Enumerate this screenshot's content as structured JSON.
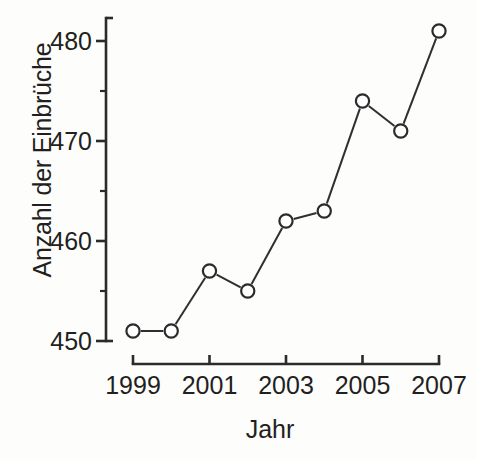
{
  "chart_data": {
    "type": "line",
    "title": "",
    "subtitle": "",
    "xlabel": "Jahr",
    "ylabel": "Anzahl der Einbrüche",
    "x": [
      1999,
      2000,
      2001,
      2002,
      2003,
      2004,
      2005,
      2006,
      2007
    ],
    "categories": [
      "1999",
      "2000",
      "2001",
      "2002",
      "2003",
      "2004",
      "2005",
      "2006",
      "2007"
    ],
    "values": [
      451,
      451,
      457,
      455,
      462,
      463,
      474,
      471,
      481
    ],
    "series": [
      {
        "name": "Anzahl der Einbrüche",
        "values": [
          451,
          451,
          457,
          455,
          462,
          463,
          474,
          471,
          481
        ]
      }
    ],
    "xlim": [
      1999,
      2007
    ],
    "ylim": [
      450,
      481.5
    ],
    "y_ticks_major": [
      450,
      460,
      470,
      480
    ],
    "y_ticks_minor": [
      455,
      465,
      475
    ],
    "y_tick_labels": [
      "450",
      "460",
      "470",
      "480"
    ],
    "x_ticks_major": [
      1999,
      2001,
      2003,
      2005,
      2007
    ],
    "x_tick_labels": [
      "1999",
      "2001",
      "2003",
      "2005",
      "2007"
    ],
    "grid": false,
    "legend": false,
    "legend_position": "none",
    "marker": "open-circle",
    "colors": {
      "line": "#2f2f2f",
      "marker_fill": "#ffffff",
      "marker_stroke": "#2b2b2b",
      "axis": "#2b2b2b",
      "text": "#231f20",
      "background": "#fdfdfc"
    },
    "annotations": []
  },
  "axes": {
    "y_title": "Anzahl der Einbrüche",
    "x_title": "Jahr"
  }
}
